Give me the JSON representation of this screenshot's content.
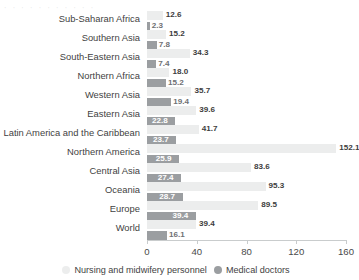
{
  "top_artifact_text": "  ˌ        ˌ            ˌ          ˌ        ˌ ˌ ˌ  ˌ ˌ ˌ  ˌ ",
  "legend": {
    "nurse_label": "Nursing and midwifery personnel",
    "doctor_label": "Medical doctors",
    "nurse_color": "#eceded",
    "doctor_color": "#9b9ea1"
  },
  "chart_data": {
    "type": "bar",
    "orientation": "horizontal",
    "title": "",
    "xlabel": "",
    "ylabel": "",
    "xlim": [
      0,
      160
    ],
    "ticks": [
      "0",
      "40",
      "80",
      "120",
      "160"
    ],
    "grid": false,
    "legend_position": "bottom",
    "categories": [
      "Sub-Saharan Africa",
      "Southern Asia",
      "South-Eastern Asia",
      "Northern Africa",
      "Western Asia",
      "Eastern Asia",
      "Latin America and the Caribbean",
      "Northern America",
      "Central Asia",
      "Oceania",
      "Europe",
      "World"
    ],
    "series": [
      {
        "name": "Nursing and midwifery personnel",
        "color": "#eceded",
        "values": [
          12.6,
          15.2,
          34.3,
          18.0,
          35.7,
          39.6,
          41.7,
          152.1,
          83.6,
          95.3,
          89.5,
          39.4
        ],
        "labels": [
          "12.6",
          "15.2",
          "34.3",
          "18.0",
          "35.7",
          "39.6",
          "41.7",
          "152.1",
          "83.6",
          "95.3",
          "89.5",
          "39.4"
        ]
      },
      {
        "name": "Medical doctors",
        "color": "#9b9ea1",
        "values": [
          2.3,
          7.8,
          7.4,
          15.2,
          19.4,
          22.8,
          23.7,
          25.9,
          27.4,
          28.7,
          39.4,
          16.1
        ],
        "labels": [
          "2.3",
          "7.8",
          "7.4",
          "15.2",
          "19.4",
          "22.8",
          "23.7",
          "25.9",
          "27.4",
          "28.7",
          "39.4",
          "16.1"
        ]
      }
    ]
  }
}
